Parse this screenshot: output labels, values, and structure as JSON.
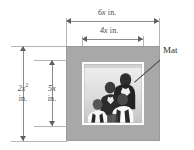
{
  "figure": {
    "background_color": "#ffffff",
    "mat": {
      "color": "#a8a8a8",
      "label": "Mat"
    },
    "photo": {
      "border_color": "#fdfdfd",
      "description": "black-and-white family portrait"
    }
  },
  "dimensions": {
    "outer_width": {
      "coefficient": "6",
      "variable": "x",
      "unit": "in.",
      "full": "6x in."
    },
    "inner_width": {
      "coefficient": "4",
      "variable": "x",
      "unit": "in.",
      "full": "4x in."
    },
    "outer_height": {
      "coefficient": "2",
      "variable": "x",
      "exponent": "2",
      "unit": "in.",
      "full": "2x2 in."
    },
    "inner_height": {
      "coefficient": "5",
      "variable": "x",
      "unit": "in.",
      "full": "5x in."
    }
  },
  "callouts": {
    "mat": "Mat"
  }
}
